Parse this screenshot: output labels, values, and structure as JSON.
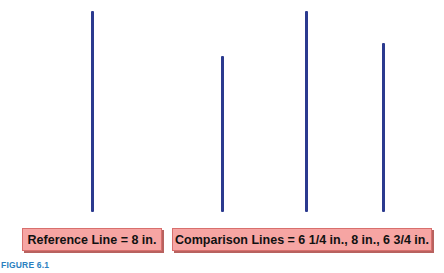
{
  "figure": {
    "caption": "FIGURE 6.1",
    "line_color": "#2b3a8f",
    "box_fill": "#f6a5a3",
    "caption_color": "#2b7fc0"
  },
  "reference": {
    "label": "Reference Line = 8 in.",
    "line": {
      "name": "reference-line",
      "length_in": 8,
      "x": 91,
      "top": 11,
      "bottom": 212
    }
  },
  "comparison": {
    "label": "Comparison Lines = 6 1/4 in., 8 in., 6 3/4 in.",
    "lines": [
      {
        "name": "comparison-line-1",
        "length_in": 6.25,
        "x": 221,
        "top": 56,
        "bottom": 212
      },
      {
        "name": "comparison-line-2",
        "length_in": 8,
        "x": 305,
        "top": 11,
        "bottom": 212
      },
      {
        "name": "comparison-line-3",
        "length_in": 6.75,
        "x": 382,
        "top": 43,
        "bottom": 212
      }
    ]
  }
}
